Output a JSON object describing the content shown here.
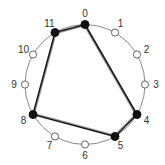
{
  "diagram": {
    "type": "clock-diagram",
    "node_count": 12,
    "nodes": [
      {
        "id": 0,
        "label": "0",
        "selected": true
      },
      {
        "id": 1,
        "label": "1",
        "selected": false
      },
      {
        "id": 2,
        "label": "2",
        "selected": false
      },
      {
        "id": 3,
        "label": "3",
        "selected": false
      },
      {
        "id": 4,
        "label": "4",
        "selected": true
      },
      {
        "id": 5,
        "label": "5",
        "selected": true
      },
      {
        "id": 6,
        "label": "6",
        "selected": false
      },
      {
        "id": 7,
        "label": "7",
        "selected": false
      },
      {
        "id": 8,
        "label": "8",
        "selected": true
      },
      {
        "id": 9,
        "label": "9",
        "selected": false
      },
      {
        "id": 10,
        "label": "10",
        "selected": false
      },
      {
        "id": 11,
        "label": "11",
        "selected": true
      }
    ],
    "edges": [
      {
        "from": 11,
        "to": 0
      },
      {
        "from": 0,
        "to": 4
      },
      {
        "from": 4,
        "to": 5
      },
      {
        "from": 5,
        "to": 8
      },
      {
        "from": 8,
        "to": 11
      }
    ],
    "colors": {
      "selected": "#111111",
      "unselected": "#ffffff",
      "circle": "#8a8a8a",
      "edge": "#1a1a1a"
    }
  }
}
